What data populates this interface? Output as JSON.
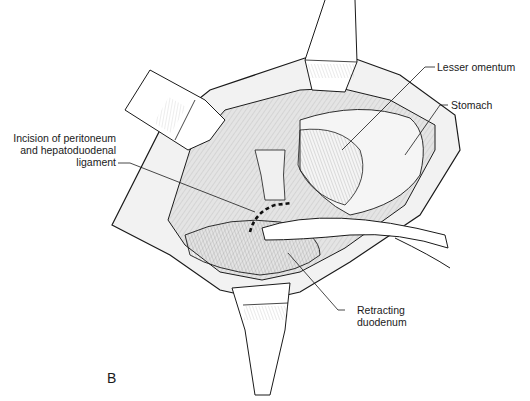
{
  "figure": {
    "panel_letter": "B",
    "labels": {
      "lesser_omentum": "Lesser omentum",
      "stomach": "Stomach",
      "incision_line1": "Incision of peritoneum",
      "incision_line2": "and hepatoduodenal",
      "incision_line3": "ligament",
      "retracting_line1": "Retracting",
      "retracting_line2": "duodenum"
    },
    "colors": {
      "line": "#1a1a1a",
      "background": "#ffffff",
      "tissue_shade": "#e6e6e6"
    }
  }
}
